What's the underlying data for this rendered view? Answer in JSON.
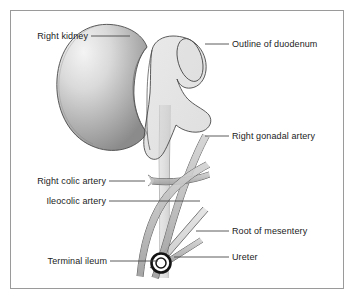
{
  "figure": {
    "frame_color": "#9a9a9a",
    "background_color": "#ffffff",
    "label_color": "#1b1b1b",
    "leader_color": "#4b4b4b",
    "outline_color": "#4a4a4a"
  },
  "structures": {
    "kidney": {
      "name": "Right kidney",
      "fill_light": "#f2f2f2",
      "fill_dark": "#8e8e8e",
      "stroke": "#4a4a4a"
    },
    "duodenum": {
      "name": "Outline of duodenum",
      "fill": "#d4d4d4",
      "stroke": "#4a4a4a"
    },
    "ureter": {
      "name": "Ureter",
      "fill": "#dcdcdc",
      "stroke": "#6e6e6e"
    },
    "gonadal_artery": {
      "name": "Right gonadal artery",
      "fill": "#c2c2c2",
      "stroke": "#555555"
    },
    "right_colic_artery": {
      "name": "Right colic artery",
      "fill": "#c2c2c2",
      "stroke": "#555555"
    },
    "ileocolic_artery": {
      "name": "Ileocolic artery",
      "fill": "#c2c2c2",
      "stroke": "#555555"
    },
    "root_of_mesentery": {
      "name": "Root of mesentery",
      "fill": "#c8c8c8",
      "stroke": "#555555"
    },
    "terminal_ileum": {
      "name": "Terminal ileum",
      "fill": "#c2c2c2",
      "stroke": "#555555"
    },
    "ileum_ring": {
      "name": "Terminal ileum cross-section ring",
      "fill": "#ffffff",
      "stroke": "#1a1a1a"
    }
  },
  "labels": [
    {
      "id": "right-kidney",
      "text": "Right kidney",
      "align": "end",
      "x": 88,
      "y": 39,
      "leader": "M 91,36 L 130,36"
    },
    {
      "id": "outline-of-duodenum",
      "text": "Outline of duodenum",
      "align": "start",
      "x": 232,
      "y": 47,
      "leader": "M 205,44 L 229,44"
    },
    {
      "id": "right-gonadal-artery",
      "text": "Right gonadal artery",
      "align": "start",
      "x": 232,
      "y": 139,
      "leader": "M 205,136 L 229,136"
    },
    {
      "id": "right-colic-artery",
      "text": "Right colic artery",
      "align": "end",
      "x": 106,
      "y": 184,
      "leader": "M 109,181 L 145,181"
    },
    {
      "id": "ileocolic-artery",
      "text": "Ileocolic artery",
      "align": "end",
      "x": 106,
      "y": 204,
      "leader": "M 109,201 L 200,201"
    },
    {
      "id": "root-of-mesentery",
      "text": "Root of mesentery",
      "align": "start",
      "x": 232,
      "y": 234,
      "leader": "M 196,231 L 229,231"
    },
    {
      "id": "ureter",
      "text": "Ureter",
      "align": "start",
      "x": 232,
      "y": 260,
      "leader": "M 174,257 L 229,257"
    },
    {
      "id": "terminal-ileum",
      "text": "Terminal ileum",
      "align": "end",
      "x": 107,
      "y": 264,
      "leader": "M 110,261 L 158,261"
    }
  ]
}
